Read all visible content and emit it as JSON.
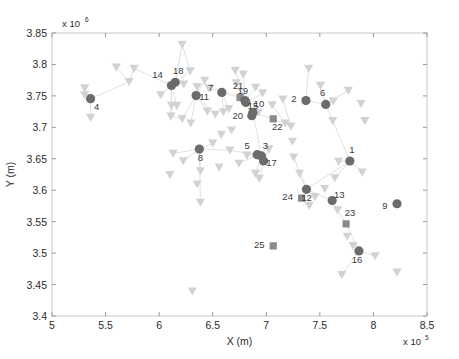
{
  "chart_data": {
    "type": "scatter",
    "title": "",
    "xlabel": "X (m)",
    "ylabel": "Y (m)",
    "x_exponent": "x 10",
    "x_exponent_power": "5",
    "y_exponent": "x 10",
    "y_exponent_power": "6",
    "xlim": [
      500000,
      850000
    ],
    "ylim": [
      3400000,
      3850000
    ],
    "xticks": [
      5,
      5.5,
      6,
      6.5,
      7,
      7.5,
      8,
      8.5
    ],
    "xtick_labels": [
      "5",
      "5.5",
      "6",
      "6.5",
      "7",
      "7.5",
      "8",
      "8.5"
    ],
    "yticks": [
      3.4,
      3.45,
      3.5,
      3.55,
      3.6,
      3.65,
      3.7,
      3.75,
      3.8,
      3.85
    ],
    "ytick_labels": [
      "3.4",
      "3.45",
      "3.5",
      "3.55",
      "3.6",
      "3.65",
      "3.7",
      "3.75",
      "3.8",
      "3.85"
    ],
    "grid": false,
    "legend": "none",
    "colors": {
      "hub_marker": "#6b6b6b",
      "square_marker": "#8a8a8a",
      "leaf_marker": "#d2d2d2",
      "edge": "#e0e0e0",
      "frame": "#c9c9c9",
      "text": "#2b2b2b"
    },
    "series": [
      {
        "name": "hubs",
        "marker": "circle",
        "color": "#6b6b6b",
        "points": [
          {
            "label": "4",
            "x": 5.36,
            "y": 3.7455,
            "lx": 6,
            "ly": 11
          },
          {
            "label": "14",
            "x": 6.115,
            "y": 3.7665,
            "lx": -14,
            "ly": -8
          },
          {
            "label": "18",
            "x": 6.15,
            "y": 3.7715,
            "lx": 3,
            "ly": -8
          },
          {
            "label": "11",
            "x": 6.345,
            "y": 3.7505,
            "lx": 8,
            "ly": 4
          },
          {
            "label": "7",
            "x": 6.585,
            "y": 3.7555,
            "lx": -11,
            "ly": -1
          },
          {
            "label": "19",
            "x": 6.8,
            "y": 3.7425,
            "lx": -2,
            "ly": -7
          },
          {
            "label": "15",
            "x": 6.81,
            "y": 3.7395,
            "lx": 7,
            "ly": 7
          },
          {
            "label": "20",
            "x": 6.865,
            "y": 3.7185,
            "lx": -14,
            "ly": 3
          },
          {
            "label": "10",
            "x": 6.875,
            "y": 3.7235,
            "lx": 6,
            "ly": -6
          },
          {
            "label": "2",
            "x": 7.37,
            "y": 3.7425,
            "lx": -12,
            "ly": 1
          },
          {
            "label": "6",
            "x": 7.555,
            "y": 3.7365,
            "lx": -3,
            "ly": -8
          },
          {
            "label": "5",
            "x": 6.915,
            "y": 3.6565,
            "lx": -10,
            "ly": -6
          },
          {
            "label": "3",
            "x": 6.955,
            "y": 3.6545,
            "lx": 4,
            "ly": -7
          },
          {
            "label": "17",
            "x": 6.975,
            "y": 3.6465,
            "lx": 8,
            "ly": 5
          },
          {
            "label": "8",
            "x": 6.375,
            "y": 3.6655,
            "lx": 1,
            "ly": 12
          },
          {
            "label": "1",
            "x": 7.78,
            "y": 3.6465,
            "lx": 2,
            "ly": -8
          },
          {
            "label": "12",
            "x": 7.375,
            "y": 3.6015,
            "lx": 0,
            "ly": 12
          },
          {
            "label": "13",
            "x": 7.615,
            "y": 3.5835,
            "lx": 7,
            "ly": -3
          },
          {
            "label": "9",
            "x": 8.22,
            "y": 3.5785,
            "lx": -12,
            "ly": 5
          },
          {
            "label": "16",
            "x": 7.865,
            "y": 3.5035,
            "lx": -2,
            "ly": 12
          }
        ]
      },
      {
        "name": "squares",
        "marker": "square",
        "color": "#8a8a8a",
        "points": [
          {
            "label": "21",
            "x": 6.755,
            "y": 3.7475,
            "lx": -2,
            "ly": -8
          },
          {
            "label": "22",
            "x": 7.065,
            "y": 3.7135,
            "lx": 4,
            "ly": 11
          },
          {
            "label": "24",
            "x": 7.33,
            "y": 3.5875,
            "lx": -14,
            "ly": 2
          },
          {
            "label": "23",
            "x": 7.745,
            "y": 3.5465,
            "lx": 4,
            "ly": -8
          },
          {
            "label": "25",
            "x": 7.065,
            "y": 3.5115,
            "lx": -14,
            "ly": 2
          }
        ]
      },
      {
        "name": "leaves",
        "marker": "triangle-down",
        "color": "#d2d2d2",
        "points": [
          {
            "x": 5.305,
            "y": 3.7625
          },
          {
            "x": 5.305,
            "y": 3.7515
          },
          {
            "x": 5.36,
            "y": 3.7155
          },
          {
            "x": 5.6,
            "y": 3.7955
          },
          {
            "x": 5.765,
            "y": 3.7935
          },
          {
            "x": 5.72,
            "y": 3.7725
          },
          {
            "x": 6.015,
            "y": 3.7515
          },
          {
            "x": 6.115,
            "y": 3.7345
          },
          {
            "x": 6.165,
            "y": 3.7345
          },
          {
            "x": 6.11,
            "y": 3.7175
          },
          {
            "x": 6.215,
            "y": 3.8315
          },
          {
            "x": 6.29,
            "y": 3.7895
          },
          {
            "x": 6.23,
            "y": 3.7685
          },
          {
            "x": 6.355,
            "y": 3.7645
          },
          {
            "x": 6.215,
            "y": 3.7135
          },
          {
            "x": 6.295,
            "y": 3.7065
          },
          {
            "x": 6.425,
            "y": 3.7745
          },
          {
            "x": 6.465,
            "y": 3.7625
          },
          {
            "x": 6.45,
            "y": 3.7255
          },
          {
            "x": 6.525,
            "y": 3.7205
          },
          {
            "x": 6.6,
            "y": 3.7245
          },
          {
            "x": 6.65,
            "y": 3.7295
          },
          {
            "x": 6.71,
            "y": 3.7905
          },
          {
            "x": 6.785,
            "y": 3.7845
          },
          {
            "x": 6.72,
            "y": 3.7705
          },
          {
            "x": 6.925,
            "y": 3.7235
          },
          {
            "x": 6.675,
            "y": 3.6955
          },
          {
            "x": 6.58,
            "y": 3.6885
          },
          {
            "x": 6.5,
            "y": 3.6745
          },
          {
            "x": 6.66,
            "y": 3.6635
          },
          {
            "x": 6.745,
            "y": 3.6425
          },
          {
            "x": 6.56,
            "y": 3.6365
          },
          {
            "x": 6.82,
            "y": 3.6555
          },
          {
            "x": 6.9,
            "y": 3.6265
          },
          {
            "x": 6.935,
            "y": 3.6185
          },
          {
            "x": 6.225,
            "y": 3.6465
          },
          {
            "x": 6.13,
            "y": 3.6585
          },
          {
            "x": 6.1,
            "y": 3.6245
          },
          {
            "x": 6.385,
            "y": 3.6305
          },
          {
            "x": 6.355,
            "y": 3.6095
          },
          {
            "x": 6.385,
            "y": 3.5805
          },
          {
            "x": 6.31,
            "y": 3.4395
          },
          {
            "x": 7.025,
            "y": 3.6655
          },
          {
            "x": 7.055,
            "y": 3.7355
          },
          {
            "x": 7.175,
            "y": 3.7065
          },
          {
            "x": 7.155,
            "y": 3.7445
          },
          {
            "x": 7.23,
            "y": 3.7015
          },
          {
            "x": 7.245,
            "y": 3.6775
          },
          {
            "x": 7.255,
            "y": 3.6525
          },
          {
            "x": 7.31,
            "y": 3.6265
          },
          {
            "x": 7.395,
            "y": 3.7935
          },
          {
            "x": 7.505,
            "y": 3.7665
          },
          {
            "x": 7.625,
            "y": 3.7415
          },
          {
            "x": 7.62,
            "y": 3.7105
          },
          {
            "x": 7.765,
            "y": 3.7585
          },
          {
            "x": 7.885,
            "y": 3.7375
          },
          {
            "x": 7.92,
            "y": 3.7105
          },
          {
            "x": 7.455,
            "y": 3.5895
          },
          {
            "x": 7.545,
            "y": 3.6025
          },
          {
            "x": 7.64,
            "y": 3.6195
          },
          {
            "x": 7.675,
            "y": 3.6455
          },
          {
            "x": 7.895,
            "y": 3.6285
          },
          {
            "x": 7.4,
            "y": 3.5755
          },
          {
            "x": 7.665,
            "y": 3.5685
          },
          {
            "x": 7.755,
            "y": 3.5265
          },
          {
            "x": 7.81,
            "y": 3.5115
          },
          {
            "x": 8.015,
            "y": 3.4955
          },
          {
            "x": 7.705,
            "y": 3.4655
          },
          {
            "x": 8.22,
            "y": 3.4695
          },
          {
            "x": 6.9,
            "y": 3.7635
          },
          {
            "x": 6.965,
            "y": 3.7545
          }
        ]
      }
    ],
    "edges": [
      [
        5.36,
        3.7455,
        5.305,
        3.7625
      ],
      [
        5.36,
        3.7455,
        5.305,
        3.7515
      ],
      [
        5.36,
        3.7455,
        5.36,
        3.7155
      ],
      [
        5.36,
        3.7455,
        5.72,
        3.7725
      ],
      [
        5.72,
        3.7725,
        5.6,
        3.7955
      ],
      [
        5.72,
        3.7725,
        5.765,
        3.7935
      ],
      [
        5.765,
        3.7935,
        6.115,
        3.7665
      ],
      [
        6.115,
        3.7665,
        6.015,
        3.7515
      ],
      [
        6.115,
        3.7665,
        6.115,
        3.7345
      ],
      [
        6.115,
        3.7665,
        6.165,
        3.7345
      ],
      [
        6.115,
        3.7665,
        6.11,
        3.7175
      ],
      [
        6.15,
        3.7715,
        6.215,
        3.8315
      ],
      [
        6.15,
        3.7715,
        6.23,
        3.7685
      ],
      [
        6.15,
        3.7715,
        6.29,
        3.7895
      ],
      [
        6.345,
        3.7505,
        6.355,
        3.7645
      ],
      [
        6.345,
        3.7505,
        6.215,
        3.7135
      ],
      [
        6.345,
        3.7505,
        6.295,
        3.7065
      ],
      [
        6.345,
        3.7505,
        6.45,
        3.7255
      ],
      [
        6.345,
        3.7505,
        6.525,
        3.7205
      ],
      [
        6.345,
        3.7505,
        6.425,
        3.7745
      ],
      [
        6.585,
        3.7555,
        6.465,
        3.7625
      ],
      [
        6.585,
        3.7555,
        6.6,
        3.7245
      ],
      [
        6.585,
        3.7555,
        6.65,
        3.7295
      ],
      [
        6.585,
        3.7555,
        6.755,
        3.7475
      ],
      [
        6.8,
        3.7425,
        6.71,
        3.7905
      ],
      [
        6.8,
        3.7425,
        6.785,
        3.7845
      ],
      [
        6.8,
        3.7425,
        6.72,
        3.7705
      ],
      [
        6.8,
        3.7425,
        6.9,
        3.7635
      ],
      [
        6.81,
        3.7395,
        6.965,
        3.7545
      ],
      [
        6.875,
        3.7235,
        6.925,
        3.7235
      ],
      [
        6.875,
        3.7235,
        7.065,
        3.7135
      ],
      [
        6.875,
        3.7235,
        6.955,
        3.6545
      ],
      [
        6.915,
        3.6565,
        6.82,
        3.6555
      ],
      [
        6.915,
        3.6565,
        6.745,
        3.6425
      ],
      [
        6.955,
        3.6545,
        6.9,
        3.6265
      ],
      [
        6.975,
        3.6465,
        6.935,
        3.6185
      ],
      [
        6.975,
        3.6465,
        7.025,
        3.6655
      ],
      [
        6.375,
        3.6655,
        6.225,
        3.6465
      ],
      [
        6.375,
        3.6655,
        6.13,
        3.6585
      ],
      [
        6.375,
        3.6655,
        6.385,
        3.6305
      ],
      [
        6.375,
        3.6655,
        6.385,
        3.5805
      ],
      [
        6.375,
        3.6655,
        6.66,
        3.6635
      ],
      [
        6.375,
        3.6655,
        6.5,
        3.6745
      ],
      [
        6.66,
        3.6635,
        6.915,
        3.6565
      ],
      [
        7.37,
        3.7425,
        7.395,
        3.7935
      ],
      [
        7.37,
        3.7425,
        7.555,
        3.7365
      ],
      [
        7.555,
        3.7365,
        7.625,
        3.7415
      ],
      [
        7.555,
        3.7365,
        7.505,
        3.7665
      ],
      [
        7.555,
        3.7365,
        7.765,
        3.7585
      ],
      [
        7.555,
        3.7365,
        7.78,
        3.6465
      ],
      [
        7.78,
        3.6465,
        7.675,
        3.6455
      ],
      [
        7.78,
        3.6465,
        7.895,
        3.6285
      ],
      [
        7.78,
        3.6465,
        7.64,
        3.6195
      ],
      [
        7.78,
        3.6465,
        7.375,
        3.6015
      ],
      [
        7.375,
        3.6015,
        7.255,
        3.6525
      ],
      [
        7.375,
        3.6015,
        7.31,
        3.6265
      ],
      [
        7.375,
        3.6015,
        7.455,
        3.5895
      ],
      [
        7.375,
        3.6015,
        7.615,
        3.5835
      ],
      [
        7.615,
        3.5835,
        7.745,
        3.5465
      ],
      [
        7.745,
        3.5465,
        7.865,
        3.5035
      ],
      [
        7.865,
        3.5035,
        7.705,
        3.4655
      ],
      [
        7.865,
        3.5035,
        8.015,
        3.4955
      ],
      [
        7.33,
        3.5875,
        7.4,
        3.5755
      ],
      [
        7.175,
        3.7065,
        7.055,
        3.7355
      ],
      [
        7.23,
        3.7015,
        7.155,
        3.7445
      ],
      [
        7.065,
        3.7135,
        7.23,
        3.7015
      ],
      [
        6.215,
        3.8315,
        6.29,
        3.7895
      ],
      [
        6.11,
        3.7175,
        6.215,
        3.7135
      ]
    ]
  },
  "plot_area": {
    "left": 52,
    "top": 33,
    "right": 427,
    "bottom": 316
  }
}
